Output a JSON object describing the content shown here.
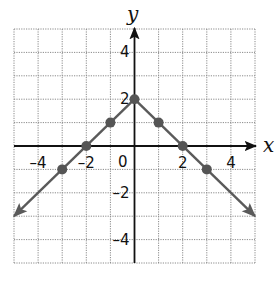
{
  "chart_data": {
    "type": "line",
    "title": "",
    "equation_implied": "y = -|x| + 2",
    "xlabel": "x",
    "ylabel": "y",
    "xlim": [
      -5,
      5
    ],
    "ylim": [
      -5,
      5
    ],
    "grid": true,
    "grid_style": "dotted",
    "x_ticks": [
      {
        "value": -4,
        "label": "–4"
      },
      {
        "value": -2,
        "label": "–2"
      },
      {
        "value": 2,
        "label": "2"
      },
      {
        "value": 4,
        "label": "4"
      }
    ],
    "y_ticks": [
      {
        "value": 4,
        "label": "4"
      },
      {
        "value": 2,
        "label": "2"
      },
      {
        "value": -2,
        "label": "–2"
      },
      {
        "value": -4,
        "label": "–4"
      }
    ],
    "origin_label": "0",
    "series": [
      {
        "name": "graph",
        "line": {
          "x": [
            -5,
            0,
            5
          ],
          "y": [
            -3,
            2,
            -3
          ]
        },
        "arrows_at_ends": true,
        "points": [
          {
            "x": -3,
            "y": -1
          },
          {
            "x": -2,
            "y": 0
          },
          {
            "x": -1,
            "y": 1
          },
          {
            "x": 0,
            "y": 2
          },
          {
            "x": 1,
            "y": 1
          },
          {
            "x": 2,
            "y": 0
          },
          {
            "x": 3,
            "y": -1
          }
        ]
      }
    ],
    "colors": {
      "line": "#5a5a5a",
      "points": "#555555",
      "axes": "#111111",
      "grid": "#8a8a8a"
    }
  }
}
